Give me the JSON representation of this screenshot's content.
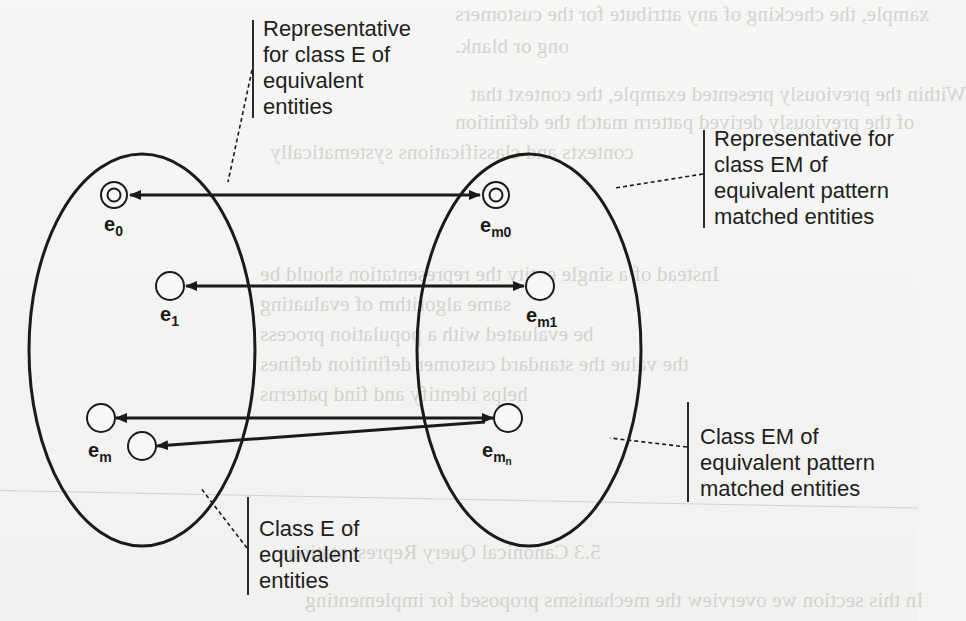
{
  "figure": {
    "type": "equivalence-class mapping diagram",
    "classes": [
      {
        "id": "E",
        "description": "Class E of equivalent entities"
      },
      {
        "id": "EM",
        "description": "Class EM of equivalent pattern matched entities"
      }
    ],
    "nodes": {
      "e0": {
        "base": "e",
        "sub": "0",
        "subsub": "",
        "representative": true
      },
      "e1": {
        "base": "e",
        "sub": "1",
        "subsub": "",
        "representative": false
      },
      "em": {
        "base": "e",
        "sub": "m",
        "subsub": "",
        "representative": false
      },
      "em0": {
        "base": "e",
        "sub": "m0",
        "subsub": "",
        "representative": true
      },
      "em1": {
        "base": "e",
        "sub": "m1",
        "subsub": "",
        "representative": false
      },
      "emn": {
        "base": "e",
        "sub": "m",
        "subsub": "n",
        "representative": false
      }
    },
    "edges": [
      {
        "from": "e0",
        "to": "em0",
        "style": "bidirectional"
      },
      {
        "from": "e1",
        "to": "em1",
        "style": "bidirectional"
      },
      {
        "from": "em_upper",
        "to": "emn",
        "style": "bidirectional"
      },
      {
        "from": "emn",
        "to": "em_lower",
        "style": "directed"
      }
    ],
    "callouts": {
      "rep_class_e": [
        "Representative",
        "for class E of",
        "equivalent",
        "entities"
      ],
      "rep_class_em": [
        "Representative for",
        "class EM of",
        "equivalent pattern",
        "matched entities"
      ],
      "class_em": [
        "Class EM of",
        "equivalent pattern",
        "matched entities"
      ],
      "class_e": [
        "Class E of",
        "equivalent",
        "entities"
      ]
    },
    "colors": {
      "ink": "#1a1a1a",
      "page": "#f4f4f2",
      "bleed_through": "#c9c9c6"
    }
  },
  "background": {
    "bleed_lines": [
      "xample, the checking of any attribute for the customers",
      "ong or blank.",
      "Within the previously presented example, the context that",
      "of the previously derived pattern match the definition",
      "contexts and classifications systematically",
      "Instead of a single entity the representation should be",
      "same algorithm of evaluating",
      "be evaluated with a population process",
      "the value the standard customer definition defines",
      "helps identify and find patterns",
      "5.3 Canonical Query Representations",
      "In this section we overview the mechanisms proposed for implementing"
    ]
  }
}
